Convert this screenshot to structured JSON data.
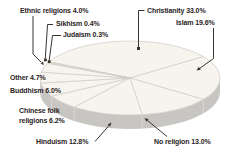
{
  "chart_data": {
    "type": "pie",
    "style": "3d",
    "unit": "%",
    "direction": "clockwise",
    "start_angle_deg": 154,
    "slices": [
      {
        "label": "Christianity",
        "value": 33.0
      },
      {
        "label": "Islam",
        "value": 19.6
      },
      {
        "label": "No religion",
        "value": 13.0
      },
      {
        "label": "Hinduism",
        "value": 12.8
      },
      {
        "label": "Chinese folk religions",
        "value": 6.2
      },
      {
        "label": "Buddhism",
        "value": 6.0
      },
      {
        "label": "Other",
        "value": 4.7
      },
      {
        "label": "Ethnic religions",
        "value": 4.0
      },
      {
        "label": "Sikhism",
        "value": 0.4
      },
      {
        "label": "Judaism",
        "value": 0.3
      }
    ],
    "colors": {
      "slice_face": "#f6f4ed",
      "slice_border": "#cfccc5",
      "rim": "#c8c6c2",
      "rim_line": "#dcdad6",
      "leader_line": "#3a342e",
      "label_text": "#2a231d",
      "background": "#ffffff"
    }
  },
  "labels": {
    "ethnic": "Ethnic religions 4.0%",
    "sikhism": "Sikhism 0.4%",
    "judaism": "Judaism 0.3%",
    "christianity": "Christianity 33.0%",
    "islam": "Islam 19.6%",
    "other": "Other 4.7%",
    "buddhism": "Buddhism 6.0%",
    "chinese_line1": "Chinese folk",
    "chinese_line2": "religions 6.2%",
    "hinduism": "Hinduism 12.8%",
    "no_religion": "No religion 13.0%"
  }
}
